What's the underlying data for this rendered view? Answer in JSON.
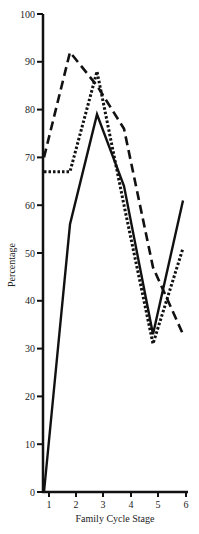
{
  "chart_data": {
    "type": "line",
    "title": "",
    "xlabel": "Family Cycle Stage",
    "ylabel": "Percentage",
    "x": [
      1,
      2,
      3,
      4,
      5,
      6
    ],
    "categories": [
      "1",
      "2",
      "3",
      "4",
      "5",
      "6"
    ],
    "xticks": [
      "1",
      "2",
      "3",
      "4",
      "5",
      "6"
    ],
    "yticks": [
      "0",
      "10",
      "20",
      "30",
      "40",
      "50",
      "60",
      "70",
      "80",
      "90",
      "100"
    ],
    "ylim": [
      0,
      100
    ],
    "grid": false,
    "legend": "none",
    "series": [
      {
        "name": "solid",
        "style": "solid",
        "color": "#111111",
        "values": [
          0,
          56,
          79,
          64,
          33,
          61
        ]
      },
      {
        "name": "dashed",
        "style": "dashed",
        "color": "#111111",
        "values": [
          70,
          92,
          85,
          76,
          47,
          33
        ]
      },
      {
        "name": "dotted",
        "style": "dotted",
        "color": "#111111",
        "values": [
          67,
          67,
          88,
          60,
          31,
          51
        ]
      }
    ]
  }
}
